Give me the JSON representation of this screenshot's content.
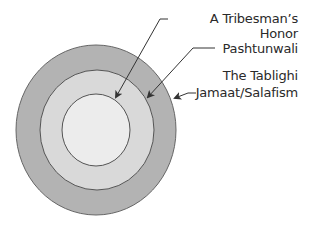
{
  "diagram": {
    "type": "concentric-circles",
    "layers": [
      {
        "name": "A Tribesman's Honor",
        "position": "inner",
        "fill": "#ececec"
      },
      {
        "name": "Pashtunwali",
        "position": "middle",
        "fill": "#d9d9d9"
      },
      {
        "name": "The Tablighi Jamaat/Salafism",
        "position": "outer",
        "fill": "#b3b3b3"
      }
    ],
    "labels": {
      "inner": "A Tribesman’s Honor",
      "middle": "Pashtunwali",
      "outer_line1": "The Tablighi",
      "outer_line2": "Jamaat/Salafism"
    },
    "colors": {
      "outer": "#b3b3b3",
      "middle": "#d9d9d9",
      "inner": "#ececec",
      "stroke": "#555555",
      "text": "#2a2a2a"
    }
  }
}
